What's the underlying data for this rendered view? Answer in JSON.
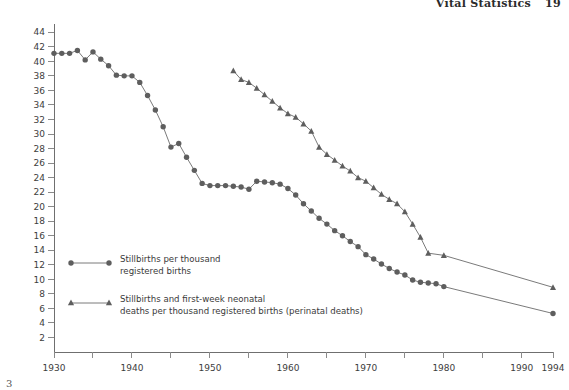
{
  "page": {
    "running_head": "Vital Statistics",
    "page_number": "19",
    "footnote_marker": "3"
  },
  "legend": {
    "entries": [
      {
        "marker": "circle-marker",
        "label": "Stillbirths per thousand\nregistered births"
      },
      {
        "marker": "triangle-marker",
        "label": "Stillbirths and first-week neonatal\ndeaths per thousand registered births (perinatal deaths)"
      }
    ]
  },
  "chart_data": {
    "type": "line",
    "title": "",
    "xlabel": "",
    "ylabel": "",
    "xlim": [
      1930,
      1994
    ],
    "ylim": [
      0,
      45
    ],
    "grid": false,
    "legend_position": "inside-lower-left",
    "x_ticks": [
      1930,
      1935,
      1940,
      1945,
      1950,
      1955,
      1960,
      1965,
      1970,
      1975,
      1980,
      1985,
      1990,
      1994
    ],
    "x_tick_labels": [
      "1930",
      "",
      "1940",
      "",
      "1950",
      "",
      "1960",
      "",
      "1970",
      "",
      "1980",
      "",
      "1990",
      "1994"
    ],
    "y_ticks": [
      2,
      4,
      6,
      8,
      10,
      12,
      14,
      16,
      18,
      20,
      22,
      24,
      26,
      28,
      30,
      32,
      34,
      36,
      38,
      40,
      42,
      44
    ],
    "y_tick_labels": [
      "2",
      "4",
      "6",
      "8",
      "10",
      "12",
      "14",
      "16",
      "18",
      "20",
      "22",
      "24",
      "26",
      "28",
      "30",
      "32",
      "34",
      "36",
      "38",
      "40",
      "42",
      "44"
    ],
    "series": [
      {
        "name": "Stillbirths per thousand registered births",
        "marker": "circle",
        "color": "#5e5e5e",
        "x": [
          1930,
          1931,
          1932,
          1933,
          1934,
          1935,
          1936,
          1937,
          1938,
          1939,
          1940,
          1941,
          1942,
          1943,
          1944,
          1945,
          1946,
          1947,
          1948,
          1949,
          1950,
          1951,
          1952,
          1953,
          1954,
          1955,
          1956,
          1957,
          1958,
          1959,
          1960,
          1961,
          1962,
          1963,
          1964,
          1965,
          1966,
          1967,
          1968,
          1969,
          1970,
          1971,
          1972,
          1973,
          1974,
          1975,
          1976,
          1977,
          1978,
          1979,
          1980,
          1994
        ],
        "values": [
          41.1,
          41.1,
          41.1,
          41.5,
          40.2,
          41.3,
          40.3,
          39.4,
          38.1,
          38.0,
          38.0,
          37.1,
          35.3,
          33.3,
          31.0,
          28.2,
          28.7,
          26.8,
          25.0,
          23.2,
          22.9,
          22.9,
          22.9,
          22.8,
          22.7,
          22.4,
          23.5,
          23.4,
          23.3,
          23.1,
          22.5,
          21.6,
          20.4,
          19.4,
          18.4,
          17.6,
          16.7,
          16.0,
          15.2,
          14.5,
          13.4,
          12.8,
          12.1,
          11.5,
          11.0,
          10.6,
          9.9,
          9.6,
          9.5,
          9.4,
          9.0,
          5.3
        ]
      },
      {
        "name": "Stillbirths and first-week neonatal deaths per thousand registered births (perinatal deaths)",
        "marker": "triangle",
        "color": "#5e5e5e",
        "x": [
          1953,
          1954,
          1955,
          1956,
          1957,
          1958,
          1959,
          1960,
          1961,
          1962,
          1963,
          1964,
          1965,
          1966,
          1967,
          1968,
          1969,
          1970,
          1971,
          1972,
          1973,
          1974,
          1975,
          1976,
          1977,
          1978,
          1980,
          1994
        ],
        "values": [
          38.7,
          37.5,
          37.1,
          36.3,
          35.4,
          34.5,
          33.6,
          32.8,
          32.3,
          31.4,
          30.4,
          28.2,
          27.2,
          26.4,
          25.6,
          24.9,
          24.0,
          23.5,
          22.6,
          21.7,
          21.0,
          20.4,
          19.3,
          17.6,
          15.8,
          13.6,
          13.3,
          8.9
        ]
      }
    ]
  }
}
